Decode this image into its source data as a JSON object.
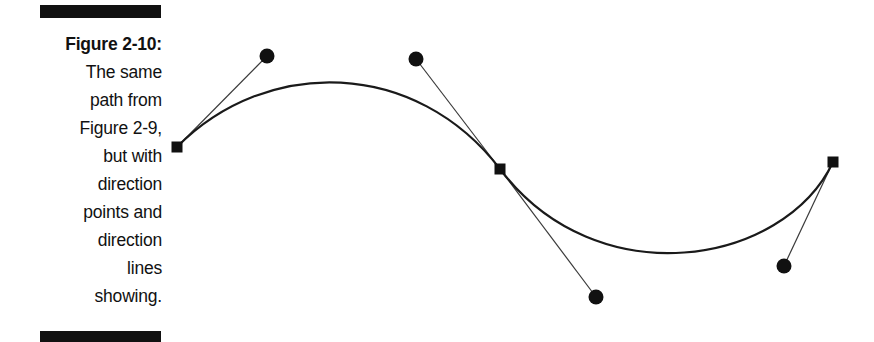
{
  "figure": {
    "caption_lines": [
      {
        "text": "Figure 2-10:",
        "bold": true
      },
      {
        "text": "The same",
        "bold": false
      },
      {
        "text": "path from",
        "bold": false
      },
      {
        "text": "Figure 2-9,",
        "bold": false
      },
      {
        "text": "but with",
        "bold": false
      },
      {
        "text": "direction",
        "bold": false
      },
      {
        "text": "points and",
        "bold": false
      },
      {
        "text": "direction",
        "bold": false
      },
      {
        "text": "lines",
        "bold": false
      },
      {
        "text": "showing.",
        "bold": false
      }
    ],
    "caption_full": "Figure 2-10: The same path from Figure 2-9, but with direction points and direction lines showing.",
    "figure_number": "Figure 2-10",
    "referenced_figure": "Figure 2-9"
  },
  "colors": {
    "ink": "#111111",
    "curve": "#1a1a1a",
    "direction_line": "#3a3a3a",
    "background": "#ffffff"
  },
  "diagram": {
    "stroke_width_curve": 2.2,
    "stroke_width_direction_line": 1.2,
    "anchor_points": [
      {
        "name": "anchor-start",
        "shape": "square",
        "x": 177,
        "y": 147,
        "size": 11
      },
      {
        "name": "anchor-middle",
        "shape": "square",
        "x": 500,
        "y": 169,
        "size": 11
      },
      {
        "name": "anchor-end",
        "shape": "square",
        "x": 833,
        "y": 162,
        "size": 11
      }
    ],
    "direction_points": [
      {
        "name": "direction-point-1",
        "shape": "circle",
        "x": 267,
        "y": 56,
        "radius": 7.5,
        "attached_to": "anchor-start"
      },
      {
        "name": "direction-point-2",
        "shape": "circle",
        "x": 416,
        "y": 59,
        "radius": 7.5,
        "attached_to": "anchor-middle"
      },
      {
        "name": "direction-point-3",
        "shape": "circle",
        "x": 596,
        "y": 297,
        "radius": 7.5,
        "attached_to": "anchor-middle"
      },
      {
        "name": "direction-point-4",
        "shape": "circle",
        "x": 784,
        "y": 266,
        "radius": 7.5,
        "attached_to": "anchor-end"
      }
    ],
    "direction_lines": [
      {
        "name": "direction-line-1",
        "x1": 177,
        "y1": 147,
        "x2": 267,
        "y2": 56
      },
      {
        "name": "direction-line-2",
        "x1": 500,
        "y1": 169,
        "x2": 416,
        "y2": 59
      },
      {
        "name": "direction-line-3",
        "x1": 500,
        "y1": 169,
        "x2": 596,
        "y2": 297
      },
      {
        "name": "direction-line-4",
        "x1": 833,
        "y1": 162,
        "x2": 784,
        "y2": 266
      }
    ],
    "curve_path": "M 177 147 C 267 56 416 59 500 169 C 596 297 784 266 833 162",
    "curve_extrema": [
      {
        "name": "peak",
        "x": 340,
        "y": 79
      },
      {
        "name": "trough",
        "x": 672,
        "y": 254
      }
    ]
  }
}
